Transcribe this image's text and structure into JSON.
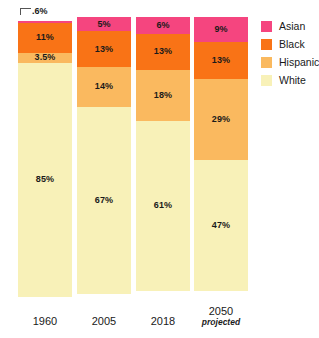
{
  "chart_data": {
    "type": "bar",
    "subtype": "stacked-100-percent",
    "title": "",
    "subtitle": "",
    "xlabel": "",
    "ylabel": "",
    "ylim": [
      0,
      100
    ],
    "grid": false,
    "legend_position": "right",
    "categories": [
      "1960",
      "2005",
      "2018",
      "2050"
    ],
    "category_sublabels": [
      "",
      "",
      "",
      "projected"
    ],
    "series": [
      {
        "name": "Asian",
        "color": "#F5457F",
        "values": [
          0.6,
          5,
          6,
          9
        ],
        "labels": [
          ".6%",
          "5%",
          "6%",
          "9%"
        ],
        "label_callout": [
          true,
          false,
          false,
          false
        ]
      },
      {
        "name": "Black",
        "color": "#F97316",
        "values": [
          11,
          13,
          13,
          13
        ],
        "labels": [
          "11%",
          "13%",
          "13%",
          "13%"
        ],
        "label_callout": [
          false,
          false,
          false,
          false
        ]
      },
      {
        "name": "Hispanic",
        "color": "#FAB95F",
        "values": [
          3.5,
          14,
          18,
          29
        ],
        "labels": [
          "3.5%",
          "14%",
          "18%",
          "29%"
        ],
        "label_callout": [
          false,
          false,
          false,
          false
        ]
      },
      {
        "name": "White",
        "color": "#F8F1B8",
        "values": [
          85,
          67,
          61,
          47
        ],
        "labels": [
          "85%",
          "67%",
          "61%",
          "47%"
        ],
        "label_callout": [
          false,
          false,
          false,
          false
        ]
      }
    ]
  },
  "legend": {
    "items": [
      {
        "label": "Asian",
        "color": "#F5457F"
      },
      {
        "label": "Black",
        "color": "#F97316"
      },
      {
        "label": "Hispanic",
        "color": "#FAB95F"
      },
      {
        "label": "White",
        "color": "#F8F1B8"
      }
    ]
  },
  "axis": {
    "ticks": [
      {
        "label": "1960",
        "sub": ""
      },
      {
        "label": "2005",
        "sub": ""
      },
      {
        "label": "2018",
        "sub": ""
      },
      {
        "label": "2050",
        "sub": "projected"
      }
    ]
  }
}
